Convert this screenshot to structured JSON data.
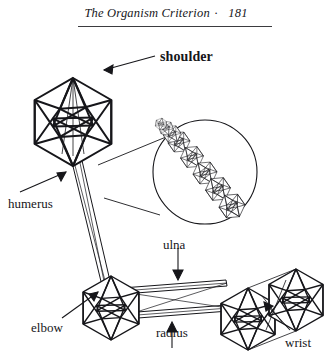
{
  "page": {
    "width": 332,
    "height": 360,
    "background": "#ffffff",
    "ink": "#16161a"
  },
  "running_head": {
    "title": "The Organism Criterion",
    "separator": "·",
    "page_number": "181",
    "rule_color": "#3b3b3f"
  },
  "figure": {
    "type": "line-diagram",
    "stroke_color": "#16161a",
    "fill_color": "#ffffff",
    "labels": [
      {
        "id": "shoulder",
        "text": "shoulder",
        "x": 160,
        "y": 50,
        "arrow_to": {
          "x": 88,
          "y": 92
        }
      },
      {
        "id": "humerus",
        "text": "humerus",
        "x": 8,
        "y": 197,
        "arrow_to": {
          "x": 96,
          "y": 160
        }
      },
      {
        "id": "ulna",
        "text": "ulna",
        "x": 163,
        "y": 238,
        "arrow_to": {
          "x": 178,
          "y": 276
        }
      },
      {
        "id": "elbow",
        "text": "elbow",
        "x": 31,
        "y": 321,
        "arrow_to": {
          "x": 101,
          "y": 288
        }
      },
      {
        "id": "radius",
        "text": "radius",
        "x": 156,
        "y": 326,
        "arrow_to": {
          "x": 172,
          "y": 300
        }
      },
      {
        "id": "wrist",
        "text": "wrist",
        "x": 285,
        "y": 336,
        "arrow_to": {
          "x": 268,
          "y": 300
        }
      }
    ],
    "nodes": [
      {
        "id": "shoulder-module",
        "shape": "icosahedron",
        "cx": 73,
        "cy": 92,
        "r": 44
      },
      {
        "id": "elbow-module",
        "shape": "icosahedron",
        "cx": 111,
        "cy": 278,
        "r": 32
      },
      {
        "id": "wrist-module-1",
        "shape": "icosahedron",
        "cx": 248,
        "cy": 289,
        "r": 31
      },
      {
        "id": "wrist-module-2",
        "shape": "icosahedron",
        "cx": 296,
        "cy": 272,
        "r": 31
      }
    ],
    "struts": [
      {
        "id": "humerus-strut",
        "from": "shoulder-module",
        "to": "elbow-module"
      },
      {
        "id": "ulna-strut",
        "from": "elbow-module",
        "to": "wrist-module-1"
      },
      {
        "id": "radius-strut",
        "from": "elbow-module",
        "to": "wrist-module-1"
      }
    ],
    "magnifier": {
      "id": "humerus-detail",
      "shape": "circle",
      "cx": 205,
      "cy": 172,
      "r": 52,
      "source_point": {
        "x": 98,
        "y": 163
      },
      "content": "chain of five small icosahedra forming the humerus strut",
      "chain_count": 5
    }
  }
}
